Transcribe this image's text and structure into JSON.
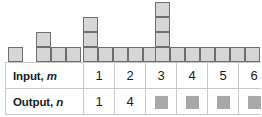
{
  "pattern": {
    "figures": [
      {
        "name": "figure-1",
        "term": 1,
        "squares": 1,
        "cells": [
          [
            0,
            0
          ]
        ],
        "left": 8,
        "cell": 15
      },
      {
        "name": "figure-2",
        "term": 2,
        "squares": 4,
        "cells": [
          [
            0,
            0
          ],
          [
            1,
            0
          ],
          [
            2,
            0
          ],
          [
            0,
            1
          ]
        ],
        "left": 36,
        "cell": 15
      },
      {
        "name": "figure-3",
        "term": 3,
        "squares": 7,
        "cells": [
          [
            0,
            0
          ],
          [
            1,
            0
          ],
          [
            2,
            0
          ],
          [
            3,
            0
          ],
          [
            4,
            0
          ],
          [
            0,
            1
          ],
          [
            0,
            2
          ]
        ],
        "left": 83,
        "cell": 15
      },
      {
        "name": "figure-4",
        "term": 4,
        "squares": 10,
        "cells": [
          [
            0,
            0
          ],
          [
            1,
            0
          ],
          [
            2,
            0
          ],
          [
            3,
            0
          ],
          [
            4,
            0
          ],
          [
            5,
            0
          ],
          [
            6,
            0
          ],
          [
            0,
            1
          ],
          [
            0,
            2
          ],
          [
            0,
            3
          ]
        ],
        "left": 155,
        "cell": 15
      }
    ],
    "square_fill": "#d6d6d6",
    "square_stroke": "#6e6e6e"
  },
  "table": {
    "rows": [
      {
        "label_text": "Input, ",
        "label_variable": "m",
        "name": "input-row",
        "cells": [
          {
            "text": "1",
            "placeholder": false
          },
          {
            "text": "2",
            "placeholder": false
          },
          {
            "text": "3",
            "placeholder": false
          },
          {
            "text": "4",
            "placeholder": false
          },
          {
            "text": "5",
            "placeholder": false
          },
          {
            "text": "6",
            "placeholder": false
          }
        ]
      },
      {
        "label_text": "Output, ",
        "label_variable": "n",
        "name": "output-row",
        "cells": [
          {
            "text": "1",
            "placeholder": false
          },
          {
            "text": "4",
            "placeholder": false
          },
          {
            "text": "",
            "placeholder": true
          },
          {
            "text": "",
            "placeholder": true
          },
          {
            "text": "",
            "placeholder": true
          },
          {
            "text": "",
            "placeholder": true
          }
        ]
      }
    ],
    "border_color": "#c9c9c9",
    "placeholder_color": "#a8a8a8"
  },
  "chart_data": {
    "type": "table",
    "title": "",
    "categories": [
      "1",
      "2",
      "3",
      "4",
      "5",
      "6"
    ],
    "series": [
      {
        "name": "Input, m",
        "values": [
          1,
          2,
          3,
          4,
          5,
          6
        ]
      },
      {
        "name": "Output, n",
        "values": [
          1,
          4,
          null,
          null,
          null,
          null
        ]
      }
    ],
    "xlabel": "Input, m",
    "ylabel": "Output, n",
    "annotations": [
      "Figure 1 has 1 square",
      "Figure 2 has 4 squares",
      "Figure 3 has 7 squares",
      "Figure 4 has 10 squares"
    ]
  }
}
